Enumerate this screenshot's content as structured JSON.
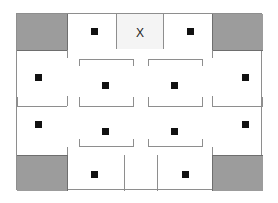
{
  "diagram": {
    "frame": {
      "x": 16,
      "y": 13,
      "width": 246,
      "height": 177,
      "border_color": "#8e8e8e"
    },
    "colors": {
      "background": "#ffffff",
      "shade_gray": "#9c9c9c",
      "tint_gray": "#f4f4f4",
      "wall": "#8e8e8e",
      "wall_dark": "#6e6e6e",
      "marker": "#111111"
    },
    "label_x": "X",
    "shaded_blocks": [
      {
        "name": "top-left-block",
        "x": 0,
        "y": 0,
        "width": 50,
        "height": 36
      },
      {
        "name": "top-right-block",
        "x": 195,
        "y": 0,
        "width": 51,
        "height": 36
      },
      {
        "name": "bottom-left-block",
        "x": 0,
        "y": 141,
        "width": 50,
        "height": 36
      },
      {
        "name": "bottom-right-block",
        "x": 195,
        "y": 141,
        "width": 51,
        "height": 36
      }
    ],
    "tinted_cells": [
      {
        "name": "x-cell-tint",
        "x": 99,
        "y": 0,
        "width": 48,
        "height": 35
      }
    ],
    "markers": [
      {
        "name": "marker-top-left-cell",
        "x": 72,
        "y": 12
      },
      {
        "name": "marker-top-right-cell",
        "x": 168,
        "y": 12
      },
      {
        "name": "marker-left-upper",
        "x": 16,
        "y": 58
      },
      {
        "name": "marker-left-lower",
        "x": 16,
        "y": 105
      },
      {
        "name": "marker-right-upper",
        "x": 223,
        "y": 58
      },
      {
        "name": "marker-right-lower",
        "x": 223,
        "y": 105
      },
      {
        "name": "marker-center-left-upper",
        "x": 83,
        "y": 66
      },
      {
        "name": "marker-center-right-upper",
        "x": 152,
        "y": 66
      },
      {
        "name": "marker-center-left-lower",
        "x": 83,
        "y": 112
      },
      {
        "name": "marker-center-right-lower",
        "x": 152,
        "y": 112
      },
      {
        "name": "marker-bottom-left-cell",
        "x": 72,
        "y": 155
      },
      {
        "name": "marker-bottom-right-cell",
        "x": 163,
        "y": 155
      }
    ],
    "vertical_walls": [
      {
        "name": "wall-top-left-inner",
        "x": 50,
        "y": 0,
        "height": 36
      },
      {
        "name": "wall-top-x-left",
        "x": 99,
        "y": 0,
        "height": 35
      },
      {
        "name": "wall-top-x-right",
        "x": 146,
        "y": 0,
        "height": 35
      },
      {
        "name": "wall-top-right-inner",
        "x": 195,
        "y": 0,
        "height": 36
      },
      {
        "name": "wall-left-tick-upper",
        "x": 50,
        "y": 36,
        "height": 8
      },
      {
        "name": "wall-right-tick-upper",
        "x": 195,
        "y": 36,
        "height": 8
      },
      {
        "name": "wall-left-mid-tick",
        "x": 50,
        "y": 82,
        "height": 10
      },
      {
        "name": "wall-right-mid-tick",
        "x": 195,
        "y": 82,
        "height": 10
      },
      {
        "name": "wall-left-tick-lower",
        "x": 50,
        "y": 133,
        "height": 8
      },
      {
        "name": "wall-right-tick-lower",
        "x": 195,
        "y": 133,
        "height": 8
      },
      {
        "name": "wall-bottom-left-inner",
        "x": 50,
        "y": 141,
        "height": 36
      },
      {
        "name": "wall-bottom-center-left",
        "x": 107,
        "y": 141,
        "height": 36
      },
      {
        "name": "wall-bottom-center-right",
        "x": 140,
        "y": 141,
        "height": 36
      },
      {
        "name": "wall-bottom-right-inner",
        "x": 195,
        "y": 141,
        "height": 36
      },
      {
        "name": "bracket-a-left-cap",
        "x": 62,
        "y": 45,
        "height": 7
      },
      {
        "name": "bracket-a-right-cap",
        "x": 116,
        "y": 45,
        "height": 7
      },
      {
        "name": "bracket-b-left-cap",
        "x": 131,
        "y": 45,
        "height": 7
      },
      {
        "name": "bracket-b-right-cap",
        "x": 185,
        "y": 45,
        "height": 7
      },
      {
        "name": "bracket-c-left-cap",
        "x": 62,
        "y": 83,
        "height": 9
      },
      {
        "name": "bracket-c-right-cap",
        "x": 116,
        "y": 83,
        "height": 9
      },
      {
        "name": "bracket-d-left-cap",
        "x": 131,
        "y": 83,
        "height": 9
      },
      {
        "name": "bracket-d-right-cap",
        "x": 185,
        "y": 83,
        "height": 9
      },
      {
        "name": "bracket-e-left-cap",
        "x": 62,
        "y": 125,
        "height": 7
      },
      {
        "name": "bracket-e-right-cap",
        "x": 116,
        "y": 125,
        "height": 7
      },
      {
        "name": "bracket-f-left-cap",
        "x": 131,
        "y": 125,
        "height": 7
      },
      {
        "name": "bracket-f-right-cap",
        "x": 185,
        "y": 125,
        "height": 7
      },
      {
        "name": "divider-left-mid-cap",
        "x": 0,
        "y": 83,
        "height": 9
      },
      {
        "name": "divider-right-mid-cap",
        "x": 245,
        "y": 83,
        "height": 9
      }
    ],
    "horizontal_walls": [
      {
        "name": "wall-top-band-left",
        "x": 0,
        "y": 36,
        "width": 50
      },
      {
        "name": "wall-top-band-right",
        "x": 195,
        "y": 36,
        "width": 51
      },
      {
        "name": "wall-bottom-band-left",
        "x": 0,
        "y": 141,
        "width": 50
      },
      {
        "name": "wall-bottom-band-right",
        "x": 195,
        "y": 141,
        "width": 51
      },
      {
        "name": "divider-left-mid",
        "x": 0,
        "y": 92,
        "width": 50
      },
      {
        "name": "divider-right-mid",
        "x": 195,
        "y": 92,
        "width": 51
      },
      {
        "name": "bracket-a-bar",
        "x": 62,
        "y": 45,
        "width": 55
      },
      {
        "name": "bracket-b-bar",
        "x": 131,
        "y": 45,
        "width": 55
      },
      {
        "name": "bracket-c-bar",
        "x": 62,
        "y": 92,
        "width": 55
      },
      {
        "name": "bracket-d-bar",
        "x": 131,
        "y": 92,
        "width": 55
      },
      {
        "name": "bracket-e-bar",
        "x": 62,
        "y": 132,
        "width": 55
      },
      {
        "name": "bracket-f-bar",
        "x": 131,
        "y": 132,
        "width": 55
      }
    ]
  }
}
